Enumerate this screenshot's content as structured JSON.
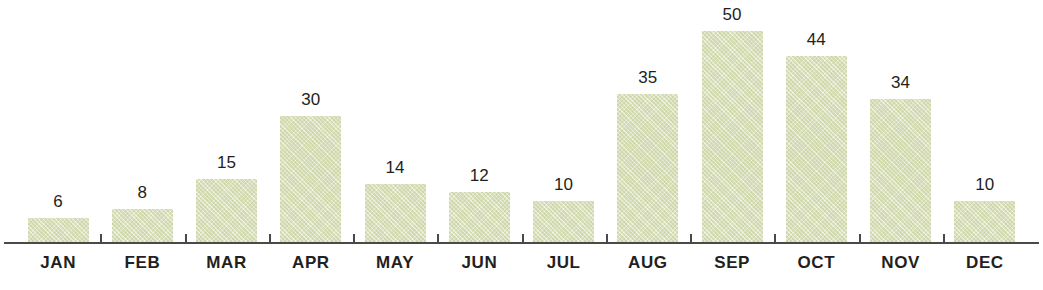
{
  "chart_data": {
    "type": "bar",
    "title": "",
    "xlabel": "",
    "ylabel": "",
    "categories": [
      "JAN",
      "FEB",
      "MAR",
      "APR",
      "MAY",
      "JUN",
      "JUL",
      "AUG",
      "SEP",
      "OCT",
      "NOV",
      "DEC"
    ],
    "values": [
      6,
      8,
      15,
      30,
      14,
      12,
      10,
      35,
      50,
      44,
      34,
      10
    ],
    "value_labels": [
      "6",
      "8",
      "15",
      "30",
      "14",
      "12",
      "10",
      "35",
      "50",
      "44",
      "34",
      "10"
    ],
    "ylim": [
      0,
      50
    ],
    "grid": false,
    "legend": null,
    "data_labels_shown": true,
    "series": [
      {
        "name": "",
        "values": [
          6,
          8,
          15,
          30,
          14,
          12,
          10,
          35,
          50,
          44,
          34,
          10
        ]
      }
    ]
  },
  "style": {
    "bar_color": "#dce2bc",
    "axis_color": "#4a4a48",
    "label_color": "#231f20",
    "value_color": "#231f20",
    "background": "#ffffff"
  }
}
